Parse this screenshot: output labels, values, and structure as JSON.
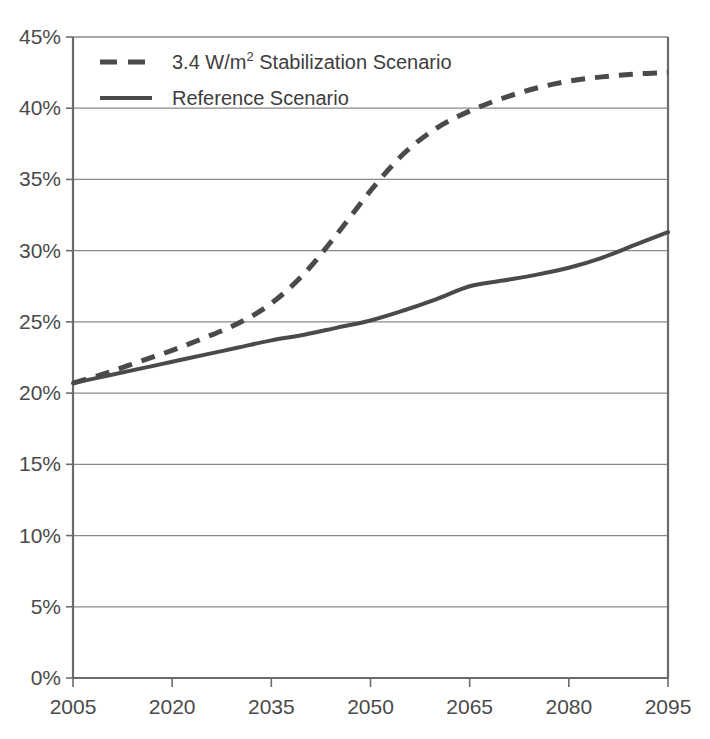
{
  "chart_data": {
    "type": "line",
    "title": "",
    "subtitle": "",
    "xlabel": "",
    "ylabel": "",
    "xlim": [
      2005,
      2095
    ],
    "ylim": [
      0,
      45
    ],
    "grid": "horizontal",
    "legend_position": "top-left",
    "x_ticks": [
      "2005",
      "2020",
      "2035",
      "2050",
      "2065",
      "2080",
      "2095"
    ],
    "x_tick_values": [
      2005,
      2020,
      2035,
      2050,
      2065,
      2080,
      2095
    ],
    "y_ticks": [
      "0%",
      "5%",
      "10%",
      "15%",
      "20%",
      "25%",
      "30%",
      "35%",
      "40%",
      "45%"
    ],
    "y_tick_values": [
      0,
      5,
      10,
      15,
      20,
      25,
      30,
      35,
      40,
      45
    ],
    "y_unit": "%",
    "x": [
      2005,
      2010,
      2015,
      2020,
      2025,
      2030,
      2035,
      2040,
      2045,
      2050,
      2055,
      2060,
      2065,
      2070,
      2075,
      2080,
      2085,
      2090,
      2095
    ],
    "series": [
      {
        "name": "3.4 W/m2 Stabilization Scenario",
        "label_main": "3.4 W/m",
        "label_sup": "2",
        "label_tail": " Stabilization Scenario",
        "style": "dashed",
        "color": "#4a4a4a",
        "width": 5,
        "dash": "14,10",
        "values": [
          20.7,
          21.4,
          22.2,
          23.0,
          23.9,
          24.9,
          26.3,
          28.4,
          31.2,
          34.2,
          36.8,
          38.6,
          39.8,
          40.7,
          41.4,
          41.9,
          42.2,
          42.4,
          42.5
        ]
      },
      {
        "name": "Reference Scenario",
        "label_main": "Reference Scenario",
        "label_sup": "",
        "label_tail": "",
        "style": "solid",
        "color": "#4a4a4a",
        "width": 4,
        "dash": "",
        "values": [
          20.7,
          21.2,
          21.7,
          22.2,
          22.7,
          23.2,
          23.7,
          24.1,
          24.6,
          25.1,
          25.8,
          26.6,
          27.5,
          27.9,
          28.3,
          28.8,
          29.5,
          30.4,
          31.3
        ]
      }
    ],
    "legend": [
      {
        "label": "3.4 W/m2 Stabilization Scenario",
        "style": "dashed",
        "color": "#4a4a4a"
      },
      {
        "label": "Reference Scenario",
        "style": "solid",
        "color": "#4a4a4a"
      }
    ],
    "axis_color": "#6b6b6b",
    "grid_color": "#8a8a8a",
    "plot_bg": "#ffffff"
  }
}
